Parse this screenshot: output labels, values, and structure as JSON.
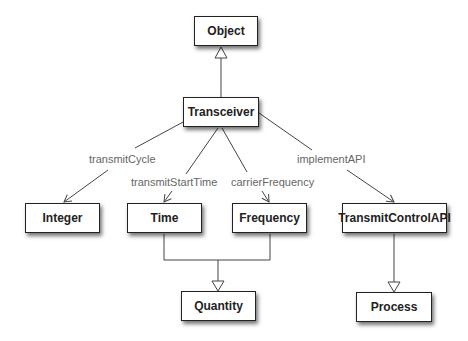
{
  "diagram": {
    "type": "uml-class-diagram",
    "nodes": [
      {
        "id": "object",
        "label": "Object",
        "x": 194,
        "y": 16,
        "w": 64,
        "h": 30
      },
      {
        "id": "transceiver",
        "label": "Transceiver",
        "x": 183,
        "y": 97,
        "w": 76,
        "h": 30
      },
      {
        "id": "integer",
        "label": "Integer",
        "x": 25,
        "y": 203,
        "w": 75,
        "h": 30
      },
      {
        "id": "time",
        "label": "Time",
        "x": 127,
        "y": 203,
        "w": 75,
        "h": 30
      },
      {
        "id": "frequency",
        "label": "Frequency",
        "x": 232,
        "y": 203,
        "w": 75,
        "h": 30
      },
      {
        "id": "transmitcontrolapi",
        "label": "TransmitControlAPI",
        "x": 342,
        "y": 203,
        "w": 105,
        "h": 30
      },
      {
        "id": "quantity",
        "label": "Quantity",
        "x": 181,
        "y": 291,
        "w": 75,
        "h": 30
      },
      {
        "id": "process",
        "label": "Process",
        "x": 356,
        "y": 292,
        "w": 76,
        "h": 30
      }
    ],
    "edges": [
      {
        "from": "transceiver",
        "to": "object",
        "kind": "generalization"
      },
      {
        "from": "transceiver",
        "to": "integer",
        "kind": "association",
        "label": "transmitCycle"
      },
      {
        "from": "transceiver",
        "to": "time",
        "kind": "association",
        "label": "transmitStartTime"
      },
      {
        "from": "transceiver",
        "to": "frequency",
        "kind": "association",
        "label": "carrierFrequency"
      },
      {
        "from": "transceiver",
        "to": "transmitcontrolapi",
        "kind": "association",
        "label": "implementAPI"
      },
      {
        "from": "time",
        "to": "quantity",
        "kind": "generalization"
      },
      {
        "from": "frequency",
        "to": "quantity",
        "kind": "generalization"
      },
      {
        "from": "transmitcontrolapi",
        "to": "process",
        "kind": "generalization"
      }
    ],
    "labels": {
      "transmitCycle": "transmitCycle",
      "transmitStartTime": "transmitStartTime",
      "carrierFrequency": "carrierFrequency",
      "implementAPI": "implementAPI"
    },
    "colors": {
      "line": "#444444",
      "label_text": "#666666",
      "box_border": "#222222",
      "box_fill": "#ffffff"
    }
  }
}
